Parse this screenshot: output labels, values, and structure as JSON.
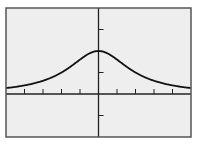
{
  "colors": {
    "page_background": "#ffffff",
    "plot_background": "#eeeeee",
    "frame": "#555555",
    "axis": "#222222",
    "curve": "#111111"
  },
  "chart_data": {
    "type": "line",
    "title": "",
    "xlabel": "",
    "ylabel": "",
    "xlim": [
      -5,
      5
    ],
    "ylim": [
      -2,
      4
    ],
    "x_ticks": [
      -4,
      -3,
      -2,
      -1,
      1,
      2,
      3,
      4
    ],
    "y_ticks": [
      -1,
      1,
      3
    ],
    "tick_labels_shown": false,
    "grid": false,
    "legend": null,
    "function_estimate": "y = 8 / (x^2 + 4)",
    "series": [
      {
        "name": "curve",
        "x": [
          -5,
          -4,
          -3,
          -2,
          -1,
          0,
          1,
          2,
          3,
          4,
          5
        ],
        "y": [
          0.28,
          0.4,
          0.62,
          1.0,
          1.6,
          2.0,
          1.6,
          1.0,
          0.62,
          0.4,
          0.28
        ]
      }
    ]
  }
}
